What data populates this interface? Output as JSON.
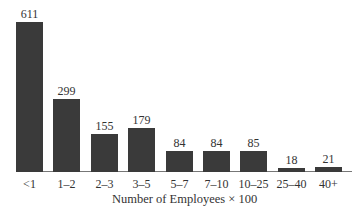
{
  "chart_data": {
    "type": "bar",
    "title": "",
    "xlabel": "Number of Employees × 100",
    "ylabel": "",
    "categories": [
      "<1",
      "1–2",
      "2–3",
      "3–5",
      "5–7",
      "7–10",
      "10–25",
      "25–40",
      "40+"
    ],
    "values": [
      611,
      299,
      155,
      179,
      84,
      84,
      85,
      18,
      21
    ],
    "value_labels": [
      "611",
      "299",
      "155",
      "179",
      "84",
      "84",
      "85",
      "18",
      "21"
    ],
    "ylim": [
      0,
      611
    ],
    "grid": false,
    "legend": null,
    "bar_color": "#3a3a3a"
  }
}
